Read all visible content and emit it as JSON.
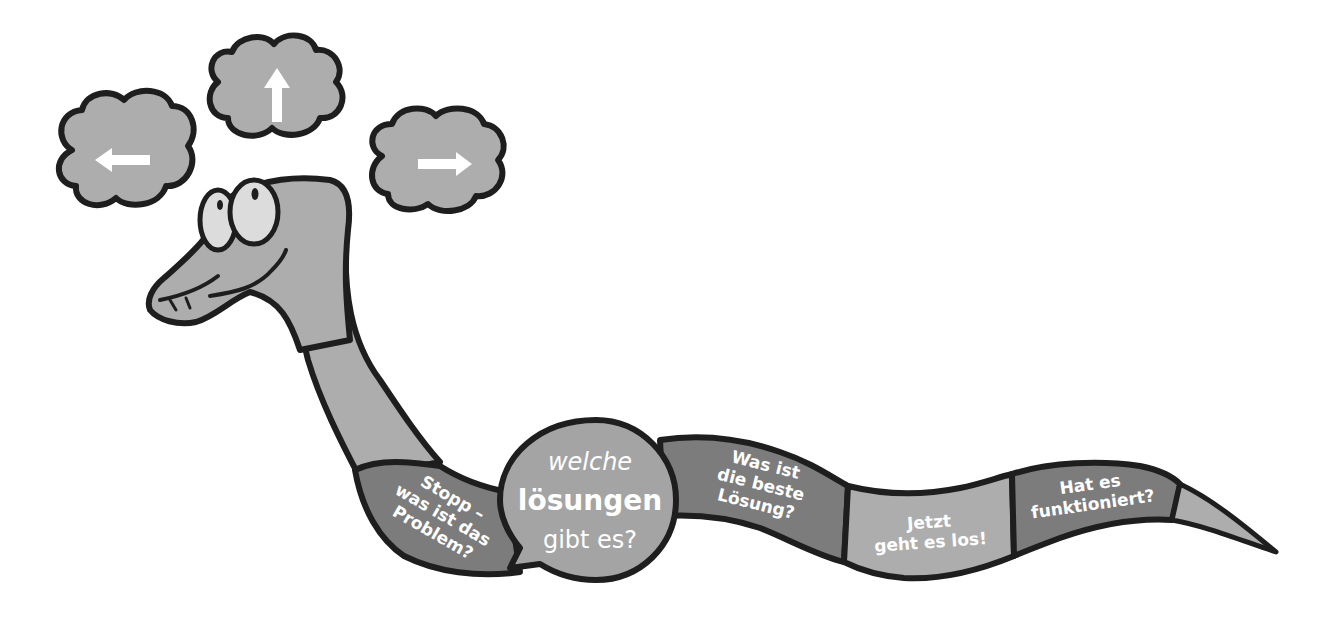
{
  "illustration": {
    "subject": "cartoon snake problem-solving path",
    "colors": {
      "background": "#ffffff",
      "outline": "#1e1e1e",
      "body_light": "#adadad",
      "body_dark": "#7c7c7c",
      "circle_fill": "#a4a4a4",
      "eye_fill": "#dcdcdc",
      "text": "#ffffff"
    },
    "thought_clouds": [
      {
        "position": "left",
        "icon": "arrow-left-icon",
        "glyph": "←"
      },
      {
        "position": "top",
        "icon": "arrow-up-icon",
        "glyph": "↑"
      },
      {
        "position": "right",
        "icon": "arrow-right-icon",
        "glyph": "→"
      }
    ],
    "steps": [
      {
        "lines": [
          "Stopp –",
          "was ist das",
          "Problem?"
        ]
      },
      {
        "lines": [
          "welche",
          "lösungen",
          "gibt es?"
        ]
      },
      {
        "lines": [
          "Was ist",
          "die beste",
          "Lösung?"
        ]
      },
      {
        "lines": [
          "Jetzt",
          "geht es los!"
        ]
      },
      {
        "lines": [
          "Hat es",
          "funktioniert?"
        ]
      }
    ]
  }
}
